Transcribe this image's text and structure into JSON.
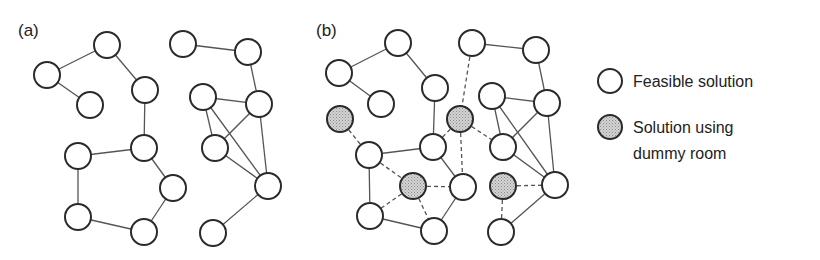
{
  "figure": {
    "panels": [
      {
        "id": "a",
        "label": "(a)",
        "label_pos": [
          18,
          36
        ],
        "nodes": [
          {
            "id": "A",
            "x": 107,
            "y": 45,
            "type": "feasible"
          },
          {
            "id": "B",
            "x": 47,
            "y": 75,
            "type": "feasible"
          },
          {
            "id": "C",
            "x": 90,
            "y": 105,
            "type": "feasible"
          },
          {
            "id": "D",
            "x": 145,
            "y": 90,
            "type": "feasible"
          },
          {
            "id": "E",
            "x": 144,
            "y": 148,
            "type": "feasible"
          },
          {
            "id": "F",
            "x": 78,
            "y": 156,
            "type": "feasible"
          },
          {
            "id": "G",
            "x": 173,
            "y": 188,
            "type": "feasible"
          },
          {
            "id": "H",
            "x": 78,
            "y": 217,
            "type": "feasible"
          },
          {
            "id": "I",
            "x": 144,
            "y": 232,
            "type": "feasible"
          },
          {
            "id": "J",
            "x": 183,
            "y": 44,
            "type": "feasible"
          },
          {
            "id": "K",
            "x": 248,
            "y": 52,
            "type": "feasible"
          },
          {
            "id": "L",
            "x": 203,
            "y": 97,
            "type": "feasible"
          },
          {
            "id": "M",
            "x": 259,
            "y": 104,
            "type": "feasible"
          },
          {
            "id": "N",
            "x": 215,
            "y": 148,
            "type": "feasible"
          },
          {
            "id": "O",
            "x": 268,
            "y": 186,
            "type": "feasible"
          },
          {
            "id": "P",
            "x": 213,
            "y": 233,
            "type": "feasible"
          }
        ],
        "edges": [
          {
            "from": "A",
            "to": "B",
            "style": "solid"
          },
          {
            "from": "B",
            "to": "C",
            "style": "solid"
          },
          {
            "from": "A",
            "to": "D",
            "style": "solid"
          },
          {
            "from": "D",
            "to": "E",
            "style": "solid"
          },
          {
            "from": "E",
            "to": "F",
            "style": "solid"
          },
          {
            "from": "F",
            "to": "H",
            "style": "solid"
          },
          {
            "from": "H",
            "to": "I",
            "style": "solid"
          },
          {
            "from": "I",
            "to": "G",
            "style": "solid"
          },
          {
            "from": "G",
            "to": "E",
            "style": "solid"
          },
          {
            "from": "J",
            "to": "K",
            "style": "solid"
          },
          {
            "from": "K",
            "to": "M",
            "style": "solid"
          },
          {
            "from": "L",
            "to": "M",
            "style": "solid"
          },
          {
            "from": "L",
            "to": "N",
            "style": "solid"
          },
          {
            "from": "L",
            "to": "O",
            "style": "solid"
          },
          {
            "from": "M",
            "to": "N",
            "style": "solid"
          },
          {
            "from": "M",
            "to": "O",
            "style": "solid"
          },
          {
            "from": "N",
            "to": "O",
            "style": "solid"
          },
          {
            "from": "O",
            "to": "P",
            "style": "solid"
          }
        ]
      },
      {
        "id": "b",
        "label": "(b)",
        "label_pos": [
          316,
          36
        ],
        "nodes": [
          {
            "id": "A",
            "x": 398,
            "y": 43,
            "type": "feasible"
          },
          {
            "id": "B",
            "x": 339,
            "y": 73,
            "type": "feasible"
          },
          {
            "id": "C",
            "x": 381,
            "y": 104,
            "type": "feasible"
          },
          {
            "id": "D",
            "x": 435,
            "y": 88,
            "type": "feasible"
          },
          {
            "id": "G1",
            "x": 340,
            "y": 119,
            "type": "dummy"
          },
          {
            "id": "E",
            "x": 433,
            "y": 147,
            "type": "feasible"
          },
          {
            "id": "G2",
            "x": 460,
            "y": 119,
            "type": "dummy"
          },
          {
            "id": "F",
            "x": 369,
            "y": 155,
            "type": "feasible"
          },
          {
            "id": "G3",
            "x": 413,
            "y": 186,
            "type": "dummy"
          },
          {
            "id": "H",
            "x": 463,
            "y": 187,
            "type": "feasible"
          },
          {
            "id": "I",
            "x": 370,
            "y": 216,
            "type": "feasible"
          },
          {
            "id": "J",
            "x": 434,
            "y": 231,
            "type": "feasible"
          },
          {
            "id": "K",
            "x": 472,
            "y": 43,
            "type": "feasible"
          },
          {
            "id": "L",
            "x": 536,
            "y": 50,
            "type": "feasible"
          },
          {
            "id": "M",
            "x": 492,
            "y": 96,
            "type": "feasible"
          },
          {
            "id": "N",
            "x": 547,
            "y": 103,
            "type": "feasible"
          },
          {
            "id": "O",
            "x": 503,
            "y": 147,
            "type": "feasible"
          },
          {
            "id": "G4",
            "x": 503,
            "y": 186,
            "type": "dummy"
          },
          {
            "id": "P",
            "x": 555,
            "y": 185,
            "type": "feasible"
          },
          {
            "id": "Q",
            "x": 501,
            "y": 232,
            "type": "feasible"
          }
        ],
        "edges": [
          {
            "from": "A",
            "to": "B",
            "style": "solid"
          },
          {
            "from": "B",
            "to": "C",
            "style": "solid"
          },
          {
            "from": "A",
            "to": "D",
            "style": "solid"
          },
          {
            "from": "D",
            "to": "E",
            "style": "solid"
          },
          {
            "from": "E",
            "to": "F",
            "style": "solid"
          },
          {
            "from": "F",
            "to": "I",
            "style": "solid"
          },
          {
            "from": "I",
            "to": "J",
            "style": "solid"
          },
          {
            "from": "J",
            "to": "H",
            "style": "solid"
          },
          {
            "from": "H",
            "to": "E",
            "style": "solid"
          },
          {
            "from": "K",
            "to": "L",
            "style": "solid"
          },
          {
            "from": "L",
            "to": "N",
            "style": "solid"
          },
          {
            "from": "M",
            "to": "N",
            "style": "solid"
          },
          {
            "from": "M",
            "to": "O",
            "style": "solid"
          },
          {
            "from": "M",
            "to": "P",
            "style": "solid"
          },
          {
            "from": "N",
            "to": "O",
            "style": "solid"
          },
          {
            "from": "N",
            "to": "P",
            "style": "solid"
          },
          {
            "from": "O",
            "to": "P",
            "style": "solid"
          },
          {
            "from": "P",
            "to": "Q",
            "style": "solid"
          },
          {
            "from": "G1",
            "to": "F",
            "style": "dashed"
          },
          {
            "from": "F",
            "to": "G3",
            "style": "dashed"
          },
          {
            "from": "G3",
            "to": "H",
            "style": "dashed"
          },
          {
            "from": "G3",
            "to": "I",
            "style": "dashed"
          },
          {
            "from": "G3",
            "to": "J",
            "style": "dashed"
          },
          {
            "from": "K",
            "to": "G2",
            "style": "dashed"
          },
          {
            "from": "G2",
            "to": "E",
            "style": "dashed"
          },
          {
            "from": "G2",
            "to": "H",
            "style": "dashed"
          },
          {
            "from": "G2",
            "to": "O",
            "style": "dashed"
          },
          {
            "from": "G4",
            "to": "P",
            "style": "dashed"
          },
          {
            "from": "G4",
            "to": "Q",
            "style": "dashed"
          }
        ]
      }
    ],
    "node_radius": 13,
    "colors": {
      "node_stroke": "#2a2a2a",
      "feasible_fill": "#ffffff",
      "dummy_fill": "#c8c8c8",
      "edge": "#555555"
    }
  },
  "legend": {
    "items": [
      {
        "type": "feasible",
        "x": 610,
        "y": 81,
        "lines": [
          "Feasible solution"
        ]
      },
      {
        "type": "dummy",
        "x": 610,
        "y": 127,
        "lines": [
          "Solution using",
          "dummy room"
        ]
      }
    ]
  }
}
